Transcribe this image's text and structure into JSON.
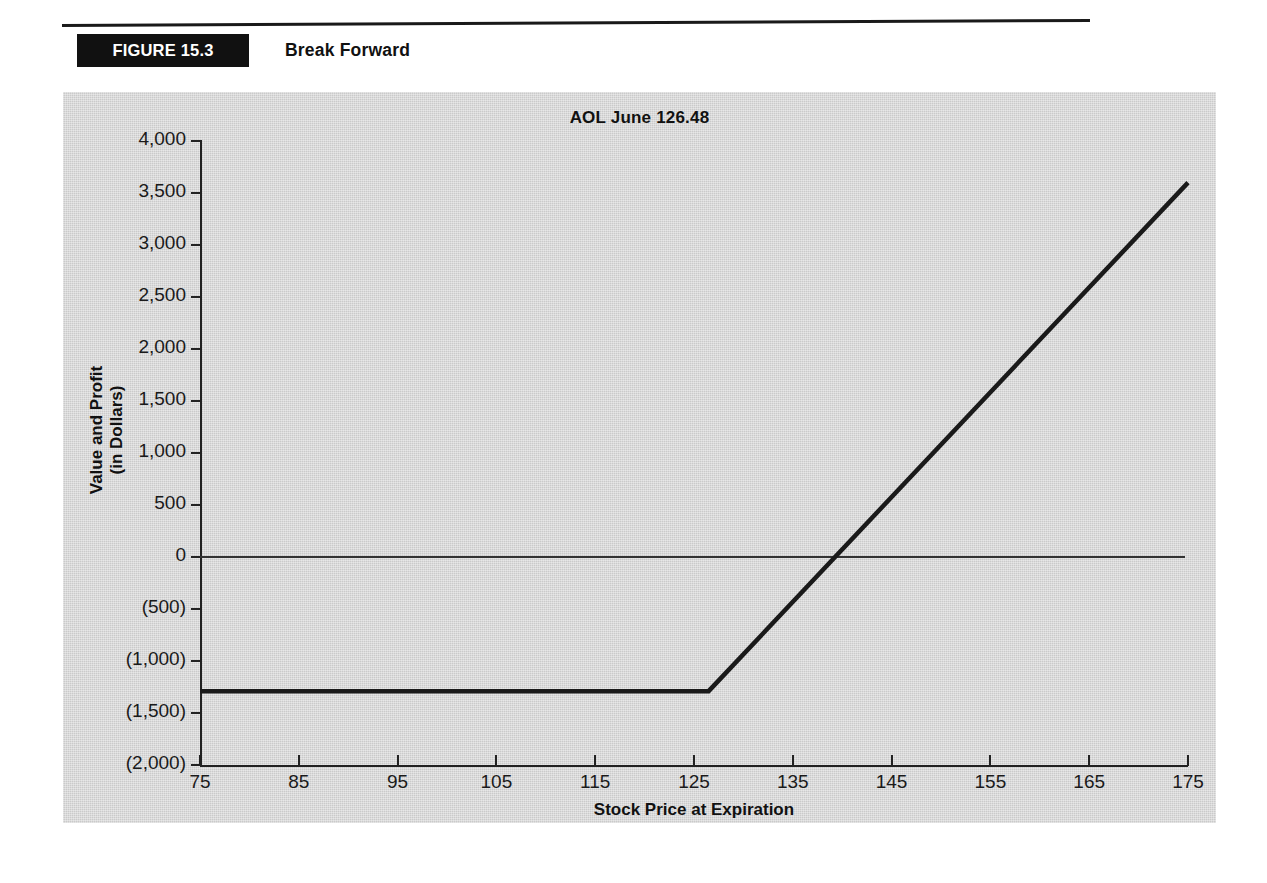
{
  "figure": {
    "label": "FIGURE 15.3",
    "caption": "Break Forward"
  },
  "chart_data": {
    "type": "line",
    "title": "AOL June 126.48",
    "xlabel": "Stock Price at Expiration",
    "ylabel": "Value and Profit\n(in Dollars)",
    "ylabel_line1": "Value and Profit",
    "ylabel_line2": "(in Dollars)",
    "xlim": [
      75,
      175
    ],
    "ylim": [
      -2000,
      4000
    ],
    "grid": false,
    "legend": null,
    "x_ticks": [
      75,
      85,
      95,
      105,
      115,
      125,
      135,
      145,
      155,
      165,
      175
    ],
    "x_tick_labels": [
      "75",
      "85",
      "95",
      "105",
      "115",
      "125",
      "135",
      "145",
      "155",
      "165",
      "175"
    ],
    "y_ticks": [
      4000,
      3500,
      3000,
      2500,
      2000,
      1500,
      1000,
      500,
      0,
      -500,
      -1000,
      -1500,
      -2000
    ],
    "y_tick_labels": [
      "4,000",
      "3,500",
      "3,000",
      "2,500",
      "2,000",
      "1,500",
      "1,000",
      "500",
      "0",
      "(500)",
      "(1,000)",
      "(1,500)",
      "(2,000)"
    ],
    "reference_lines": [
      {
        "name": "zero-line",
        "axis": "y",
        "value": 0
      }
    ],
    "strike": 126.48,
    "series": [
      {
        "name": "Break Forward Payoff",
        "color": "#1a1a1a",
        "x": [
          75,
          126.48,
          175
        ],
        "values": [
          -1290,
          -1290,
          3600
        ]
      }
    ],
    "annotations": []
  }
}
